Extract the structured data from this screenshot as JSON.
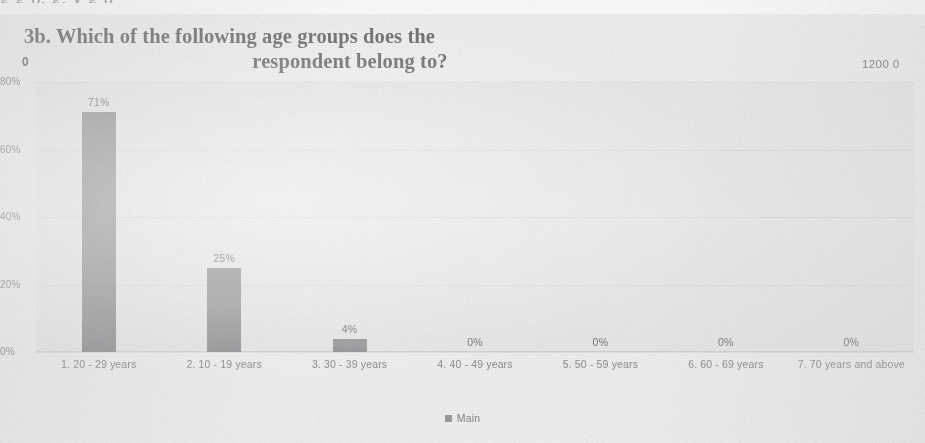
{
  "page": {
    "cropped_text_above": "g                                           g                            p, g, y g     p",
    "marker_left": "0",
    "marker_right": "1200 0"
  },
  "title": {
    "line1": "3b. Which of the following age groups does the",
    "line2": "respondent belong to?"
  },
  "legend": {
    "label": "Main",
    "swatch_name": "legend-color-swatch"
  },
  "colors": {
    "bar": "#969699",
    "plot_background": "#eaeaea",
    "page_background": "#efefef",
    "text": "#86868a",
    "title_text": "#6f6f72"
  },
  "chart_data": {
    "type": "bar",
    "title": "3b. Which of the following age groups does the respondent belong to?",
    "xlabel": "",
    "ylabel": "",
    "categories": [
      "1. 20 - 29 years",
      "2. 10 - 19 years",
      "3. 30 - 39 years",
      "4. 40 - 49 years",
      "5. 50 - 59 years",
      "6. 60 - 69 years",
      "7. 70 years and above"
    ],
    "values": [
      71,
      25,
      4,
      0,
      0,
      0,
      0
    ],
    "data_labels": [
      "71%",
      "25%",
      "4%",
      "0%",
      "0%",
      "0%",
      "0%"
    ],
    "series": [
      {
        "name": "Main",
        "values": [
          71,
          25,
          4,
          0,
          0,
          0,
          0
        ]
      }
    ],
    "ylim": [
      0,
      80
    ],
    "yticks": [
      0,
      20,
      40,
      60,
      80
    ],
    "ytick_labels": [
      "0%",
      "20%",
      "40%",
      "60%",
      "80%"
    ],
    "grid": false,
    "legend_position": "bottom"
  }
}
